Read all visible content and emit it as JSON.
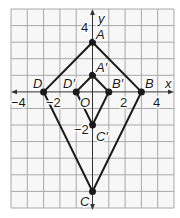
{
  "diagram": {
    "type": "coordinate-plane",
    "x_range": [
      -5,
      5
    ],
    "y_range": [
      -7,
      5
    ],
    "axis_labels": {
      "x": "x",
      "y": "y"
    },
    "x_tick_labels": [
      {
        "value": -4,
        "text": "−4"
      },
      {
        "value": -2,
        "text": "−2"
      },
      {
        "value": 2,
        "text": "2"
      },
      {
        "value": 4,
        "text": "4"
      }
    ],
    "y_tick_labels": [
      {
        "value": 4,
        "text": "4"
      },
      {
        "value": -2,
        "text": "−2"
      }
    ],
    "origin_label": "O",
    "colors": {
      "grid": "#a8a8a8",
      "line": "#1a1a1a",
      "background": "#f7f7f7"
    },
    "quadrilaterals": [
      {
        "name": "ABCD",
        "points": [
          {
            "label": "A",
            "x": 0,
            "y": 3
          },
          {
            "label": "B",
            "x": 3,
            "y": 0
          },
          {
            "label": "C",
            "x": 0,
            "y": -6
          },
          {
            "label": "D",
            "x": -3,
            "y": 0
          }
        ]
      },
      {
        "name": "A'B'C'D'",
        "points": [
          {
            "label": "A′",
            "x": 0,
            "y": 1
          },
          {
            "label": "B′",
            "x": 1,
            "y": 0
          },
          {
            "label": "C′",
            "x": 0,
            "y": -2
          },
          {
            "label": "D′",
            "x": -1,
            "y": 0
          }
        ]
      }
    ],
    "labels": {
      "A": "A",
      "B": "B",
      "C": "C",
      "D": "D",
      "A_prime": "A′",
      "B_prime": "B′",
      "C_prime": "C′",
      "D_prime": "D′",
      "x_axis": "x",
      "y_axis": "y",
      "origin": "O",
      "x_neg4": "−4",
      "x_neg2": "−2",
      "x_2": "2",
      "x_4": "4",
      "y_4": "4",
      "y_neg2": "−2"
    }
  }
}
